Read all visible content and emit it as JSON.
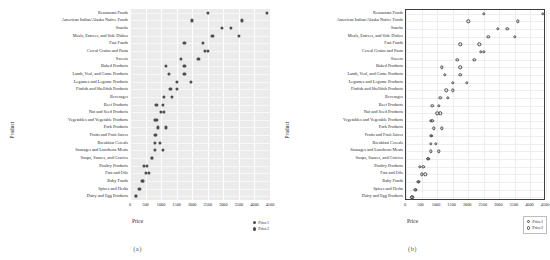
{
  "figure": {
    "caption_a": "(a)",
    "caption_b": "(b)"
  },
  "chart_data": {
    "type": "scatter",
    "title": "",
    "xlabel": "Price",
    "ylabel": "Product",
    "xlim": [
      0,
      4500
    ],
    "xticks": [
      0,
      500,
      1000,
      1500,
      2000,
      2500,
      3000,
      3500,
      4000,
      4500
    ],
    "grid": true,
    "legend_position": "bottom-right",
    "legend": [
      "Price1",
      "Price2"
    ],
    "categories": [
      "Restaurant Foods",
      "American Indian/Alaska Native Foods",
      "Snacks",
      "Meals, Entrees, and Side Dishes",
      "Fast Foods",
      "Cereal Grains and Pasta",
      "Sweets",
      "Baked Products",
      "Lamb, Veal, and Game Products",
      "Legumes and Legume Products",
      "Finfish and Shellfish Products",
      "Beverages",
      "Beef Products",
      "Nut and Seed Products",
      "Vegetables and Vegetable Products",
      "Pork Products",
      "Fruits and Fruit Juices",
      "Breakfast Cereals",
      "Sausages and Luncheon Meats",
      "Soups, Sauces, and Gravies",
      "Poultry Products",
      "Fats and Oils",
      "Baby Foods",
      "Spices and Herbs",
      "Dairy and Egg Products"
    ],
    "series": [
      {
        "name": "Price1",
        "values": [
          2500,
          2000,
          2950,
          2650,
          1750,
          2400,
          1650,
          1150,
          1250,
          1500,
          1300,
          1100,
          850,
          1000,
          800,
          900,
          800,
          800,
          800,
          700,
          450,
          500,
          400,
          300,
          180
        ]
      },
      {
        "name": "Price2",
        "values": [
          4400,
          3600,
          3250,
          3500,
          2350,
          2500,
          2200,
          1750,
          1750,
          1950,
          1500,
          1350,
          1050,
          1100,
          850,
          1150,
          820,
          950,
          1050,
          720,
          550,
          620,
          420,
          320,
          200
        ]
      }
    ]
  }
}
